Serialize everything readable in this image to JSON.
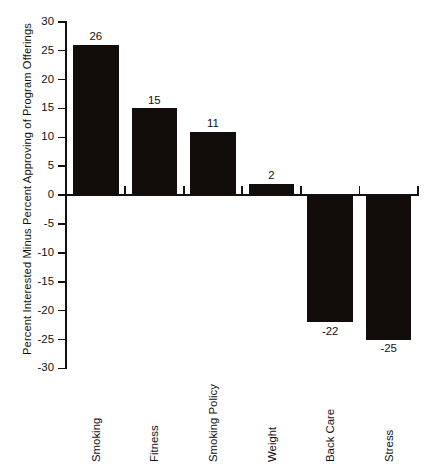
{
  "chart_data": {
    "type": "bar",
    "title": "",
    "subtitle": "",
    "xlabel": "",
    "ylabel": "Percent Interested Minus Percent Approving of Program Offerings",
    "categories": [
      "Smoking",
      "Fitness",
      "Smoking Policy",
      "Weight",
      "Back Care",
      "Stress"
    ],
    "values": [
      26,
      15,
      11,
      2,
      -22,
      -25
    ],
    "value_labels": [
      "26",
      "15",
      "11",
      "2",
      "-22",
      "-25"
    ],
    "ylim": [
      -30,
      30
    ],
    "yticks": [
      30,
      25,
      20,
      15,
      10,
      5,
      0,
      -5,
      -10,
      -15,
      -20,
      -25,
      -30
    ],
    "ytick_labels": [
      "30",
      "25",
      "20",
      "15",
      "10",
      "5",
      "0",
      "-5",
      "-10",
      "-15",
      "-20",
      "-25",
      "-30"
    ],
    "grid": false,
    "legend": null,
    "legend_position": "none",
    "bar_color": "#120d0b",
    "axis_color": "#111111",
    "background_color": "#ffffff"
  }
}
